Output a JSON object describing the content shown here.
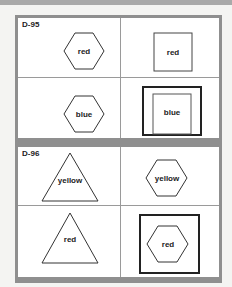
{
  "panels": [
    {
      "id": "D-95",
      "cells": [
        {
          "shape": "hexagon",
          "text": "red",
          "framed": false
        },
        {
          "shape": "square",
          "text": "red",
          "framed": false
        },
        {
          "shape": "hexagon",
          "text": "blue",
          "framed": false
        },
        {
          "shape": "square",
          "text": "blue",
          "framed": true
        }
      ]
    },
    {
      "id": "D-96",
      "cells": [
        {
          "shape": "triangle",
          "text": "yellow",
          "framed": false
        },
        {
          "shape": "hexagon",
          "text": "yellow",
          "framed": false
        },
        {
          "shape": "triangle",
          "text": "red",
          "framed": false
        },
        {
          "shape": "hexagon",
          "text": "red",
          "framed": true
        }
      ]
    }
  ],
  "colors": {
    "frame": "#8f8f8f",
    "stroke": "#333333",
    "divider": "#9a9a9a"
  }
}
